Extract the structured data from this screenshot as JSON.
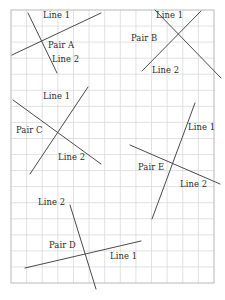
{
  "figure": {
    "background_color": "#ffffff",
    "grid": {
      "x": 11,
      "y": 10,
      "width": 203,
      "height": 273,
      "cols": 13,
      "rows": 17,
      "cell_size": 15.6,
      "line_color": "#d9d9d9",
      "border_color": "#b8b8b8",
      "visible": true
    },
    "line_color": "#4a4a4a",
    "line_width": 1.0,
    "text_color": "#2b2b2b"
  },
  "pairs": [
    {
      "id": "pair-a",
      "name": "Pair A",
      "label": "Pair A",
      "label_x": 48,
      "label_y": 41,
      "lines": [
        {
          "name": "Line 1",
          "label": "Line 1",
          "label_x": 43,
          "label_y": 11,
          "x1": 12,
          "y1": 55,
          "x2": 101,
          "y2": 13
        },
        {
          "name": "Line 2",
          "label": "Line 2",
          "label_x": 52,
          "label_y": 55,
          "x1": 28,
          "y1": 13,
          "x2": 57,
          "y2": 73
        }
      ]
    },
    {
      "id": "pair-b",
      "name": "Pair B",
      "label": "Pair B",
      "label_x": 131,
      "label_y": 34,
      "lines": [
        {
          "name": "Line 1",
          "label": "Line 1",
          "label_x": 156,
          "label_y": 11,
          "x1": 155,
          "y1": 10,
          "x2": 221,
          "y2": 78
        },
        {
          "name": "Line 2",
          "label": "Line 2",
          "label_x": 152,
          "label_y": 66,
          "x1": 142,
          "y1": 71,
          "x2": 201,
          "y2": 11
        }
      ]
    },
    {
      "id": "pair-c",
      "name": "Pair C",
      "label": "Pair C",
      "label_x": 16,
      "label_y": 126,
      "lines": [
        {
          "name": "Line 1",
          "label": "Line 1",
          "label_x": 43,
          "label_y": 92,
          "x1": 30,
          "y1": 174,
          "x2": 88,
          "y2": 87
        },
        {
          "name": "Line 2",
          "label": "Line 2",
          "label_x": 58,
          "label_y": 153,
          "x1": 13,
          "y1": 100,
          "x2": 101,
          "y2": 164
        }
      ]
    },
    {
      "id": "pair-d",
      "name": "Pair D",
      "label": "Pair D",
      "label_x": 49,
      "label_y": 241,
      "lines": [
        {
          "name": "Line 1",
          "label": "Line 1",
          "label_x": 110,
          "label_y": 252,
          "x1": 25,
          "y1": 268,
          "x2": 141,
          "y2": 241
        },
        {
          "name": "Line 2",
          "label": "Line 2",
          "label_x": 38,
          "label_y": 198,
          "x1": 70,
          "y1": 205,
          "x2": 96,
          "y2": 289
        }
      ]
    },
    {
      "id": "pair-e",
      "name": "Pair E",
      "label": "Pair E",
      "label_x": 138,
      "label_y": 163,
      "lines": [
        {
          "name": "Line 1",
          "label": "Line 1",
          "label_x": 188,
          "label_y": 123,
          "x1": 152,
          "y1": 219,
          "x2": 195,
          "y2": 103
        },
        {
          "name": "Line 2",
          "label": "Line 2",
          "label_x": 180,
          "label_y": 180,
          "x1": 130,
          "y1": 145,
          "x2": 220,
          "y2": 184
        }
      ]
    }
  ]
}
